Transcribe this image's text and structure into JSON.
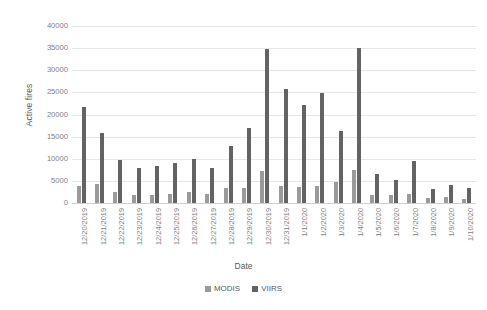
{
  "chart_data": {
    "type": "bar",
    "title": "",
    "xlabel": "Date",
    "ylabel": "Active fires",
    "ylim": [
      0,
      40000
    ],
    "yticks": [
      0,
      5000,
      10000,
      15000,
      20000,
      25000,
      30000,
      35000,
      40000
    ],
    "grid": true,
    "legend_position": "bottom",
    "categories": [
      "12/20/2019",
      "12/21/2019",
      "12/22/2019",
      "12/23/2019",
      "12/24/2019",
      "12/25/2019",
      "12/26/2019",
      "12/27/2019",
      "12/28/2019",
      "12/29/2019",
      "12/30/2019",
      "12/31/2019",
      "1/1/2020",
      "1/2/2020",
      "1/3/2020",
      "1/4/2020",
      "1/5/2020",
      "1/6/2020",
      "1/7/2020",
      "1/8/2020",
      "1/9/2020",
      "1/10/2020"
    ],
    "series": [
      {
        "name": "MODIS",
        "color": "#9a9a9a",
        "values": [
          3900,
          4200,
          2600,
          1900,
          1900,
          2100,
          2600,
          2100,
          3400,
          3500,
          7200,
          3800,
          3600,
          3900,
          4700,
          7500,
          1900,
          1900,
          2000,
          1100,
          1400,
          1000
        ]
      },
      {
        "name": "VIIRS",
        "color": "#636363",
        "values": [
          21600,
          15800,
          9700,
          8000,
          8300,
          9100,
          9900,
          8000,
          12900,
          16900,
          34900,
          25700,
          22100,
          24900,
          16200,
          35000,
          6600,
          5300,
          9400,
          3100,
          4100,
          3300
        ]
      }
    ],
    "legend": [
      {
        "label": "MODIS",
        "swatch": "modis"
      },
      {
        "label": "VIIRS",
        "swatch": "viirs"
      }
    ]
  }
}
